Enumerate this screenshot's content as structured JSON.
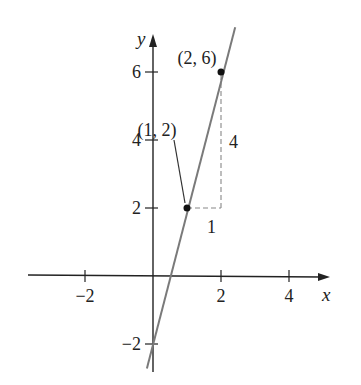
{
  "chart_data": {
    "type": "line",
    "title": "",
    "xlabel": "x",
    "ylabel": "y",
    "xlim": [
      -3.6,
      5.0
    ],
    "ylim": [
      -2.7,
      7.2
    ],
    "x_ticks": [
      {
        "value": -2,
        "label": "−2"
      },
      {
        "value": 2,
        "label": "2"
      },
      {
        "value": 4,
        "label": "4"
      }
    ],
    "y_ticks": [
      {
        "value": -2,
        "label": "−2"
      },
      {
        "value": 2,
        "label": "2"
      },
      {
        "value": 4,
        "label": "4"
      },
      {
        "value": 6,
        "label": "6"
      }
    ],
    "series": [
      {
        "name": "line",
        "equation": "y = 4x - 2",
        "slope": 4,
        "intercept": -2,
        "x_range": [
          -0.18,
          2.3
        ],
        "color": "#7a7a7a"
      }
    ],
    "points": [
      {
        "x": 1,
        "y": 2,
        "label": "(1, 2)"
      },
      {
        "x": 2,
        "y": 6,
        "label": "(2, 6)"
      }
    ],
    "annotations": {
      "run_label": "1",
      "rise_label": "4"
    },
    "grid": false
  }
}
